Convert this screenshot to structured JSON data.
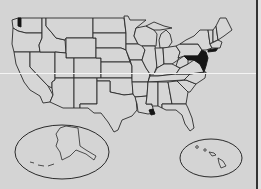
{
  "map": {
    "title": "United States",
    "type": "choropleth-outline",
    "colors": {
      "background": "#d4d4d4",
      "state_fill": "#d6d6d6",
      "border": "#2a2a2a",
      "highlight": "#151515"
    },
    "highlighted_regions": [
      "Washington (Puget Sound)",
      "New Jersey",
      "Delaware",
      "Maryland",
      "Mississippi River delta"
    ],
    "insets": [
      {
        "name": "Alaska",
        "shape": "ellipse"
      },
      {
        "name": "Hawaii",
        "shape": "ellipse"
      }
    ]
  }
}
